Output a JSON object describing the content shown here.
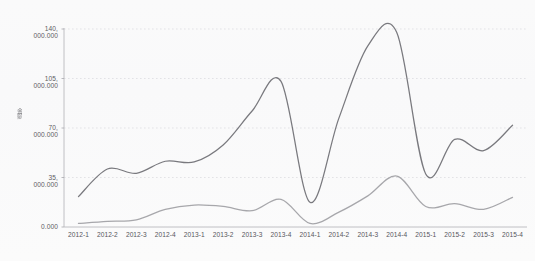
{
  "chart_data": {
    "type": "line",
    "title": "",
    "subtitle": "",
    "xlabel": "",
    "ylabel": "金额",
    "ylabel_note": "rotated vertical axis caption, illegible in scan",
    "legend": [],
    "legend_position": "none",
    "grid": true,
    "grid_style": "dotted-horizontal",
    "ylim": [
      0,
      140000
    ],
    "ytick_labels": [
      "140,000.000",
      "105,000.000",
      "70,000.000",
      "35,000.000",
      "0.000"
    ],
    "ytick_values": [
      140000,
      105000,
      70000,
      35000,
      0
    ],
    "categories": [
      "2012-1",
      "2012-2",
      "2012-3",
      "2012-4",
      "2013-1",
      "2013-2",
      "2013-3",
      "2013-4",
      "2014-1",
      "2014-2",
      "2014-3",
      "2014-4",
      "2015-1",
      "2015-2",
      "2015-3",
      "2015-4"
    ],
    "series": [
      {
        "name": "series-upper",
        "color": "#6f6f74",
        "values": [
          21500,
          41000,
          38000,
          46500,
          46000,
          58000,
          82000,
          103000,
          17500,
          77000,
          128000,
          137500,
          37500,
          62000,
          54000,
          72000
        ]
      },
      {
        "name": "series-lower",
        "color": "#a0a0a5",
        "values": [
          2500,
          4000,
          5000,
          12500,
          15500,
          14500,
          11500,
          19500,
          2500,
          10500,
          22000,
          36000,
          14500,
          16500,
          12500,
          21000
        ]
      }
    ]
  },
  "axis": {
    "y_title": "金额"
  }
}
